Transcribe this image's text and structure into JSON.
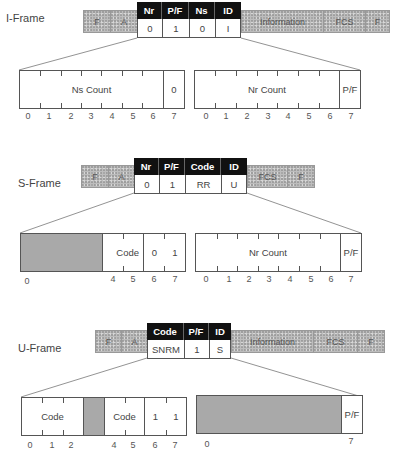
{
  "iframe": {
    "label": "I-Frame",
    "outer_fields": {
      "f1": "F",
      "a": "A",
      "info": "Information",
      "fcs": "FCS",
      "f2": "F"
    },
    "control_headers": [
      "Nr",
      "P/F",
      "Ns",
      "ID"
    ],
    "control_values": [
      "0",
      "1",
      "0",
      "I"
    ],
    "left_byte": {
      "field": "Ns Count",
      "bit7": "0"
    },
    "right_byte": {
      "field": "Nr Count",
      "bit7": "P/F"
    },
    "bits": [
      "0",
      "1",
      "2",
      "3",
      "4",
      "5",
      "6",
      "7"
    ]
  },
  "sframe": {
    "label": "S-Frame",
    "outer_fields": {
      "f1": "F",
      "a": "A",
      "fcs": "FCS",
      "f2": "F"
    },
    "control_headers": [
      "Nr",
      "P/F",
      "Code",
      "ID"
    ],
    "control_values": [
      "0",
      "1",
      "RR",
      "U"
    ],
    "left_byte": {
      "code": "Code",
      "bit6": "0",
      "bit7": "1",
      "labels": [
        "0",
        "4",
        "5",
        "6",
        "7"
      ]
    },
    "right_byte": {
      "field": "Nr Count",
      "bit7": "P/F"
    },
    "bits": [
      "0",
      "1",
      "2",
      "3",
      "4",
      "5",
      "6",
      "7"
    ]
  },
  "uframe": {
    "label": "U-Frame",
    "outer_fields": {
      "f1": "F",
      "a": "A",
      "info": "Information",
      "fcs": "FCS",
      "f2": "F"
    },
    "control_headers": [
      "Code",
      "P/F",
      "ID"
    ],
    "control_values": [
      "SNRM",
      "1",
      "S"
    ],
    "left_byte": {
      "code1": "Code",
      "code2": "Code",
      "bit6": "1",
      "bit7": "1",
      "labels": [
        "0",
        "1",
        "2",
        "4",
        "5",
        "6",
        "7"
      ]
    },
    "right_byte": {
      "bit7": "P/F",
      "labels": [
        "0",
        "7"
      ]
    }
  }
}
